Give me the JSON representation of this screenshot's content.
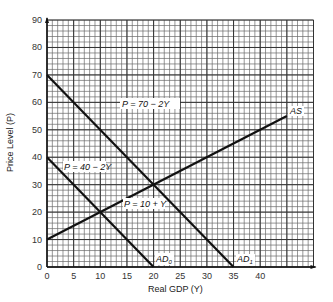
{
  "chart_data": {
    "type": "line",
    "title": "",
    "xlabel": "Real GDP (Y)",
    "ylabel": "Price Level (P)",
    "xlim": [
      0,
      50
    ],
    "ylim": [
      0,
      90
    ],
    "x_ticks": [
      0,
      5,
      10,
      15,
      20,
      25,
      30,
      35,
      40
    ],
    "y_ticks": [
      0,
      10,
      20,
      30,
      40,
      50,
      60,
      70,
      80,
      90
    ],
    "grid": true,
    "series": [
      {
        "name": "AS",
        "equation": "P = 10 + Y",
        "label": "P = 10 + Y",
        "x": [
          0,
          45
        ],
        "y": [
          10,
          55
        ]
      },
      {
        "name": "AD0",
        "equation": "P = 40 - 2Y",
        "label": "P = 40 − 2Y",
        "x": [
          0,
          20
        ],
        "y": [
          40,
          0
        ]
      },
      {
        "name": "AD1",
        "equation": "P = 70 - 2Y",
        "label": "P = 70 − 2Y",
        "x": [
          0,
          35
        ],
        "y": [
          70,
          0
        ]
      }
    ],
    "annotations": [
      {
        "text": "AS",
        "x": 45,
        "y": 55
      },
      {
        "text": "AD0",
        "x": 20,
        "y": 0
      },
      {
        "text": "AD1",
        "x": 35,
        "y": 0
      },
      {
        "text": "P = 70 − 2Y",
        "x": 14,
        "y": 61
      },
      {
        "text": "P = 40 − 2Y",
        "x": 6,
        "y": 37
      },
      {
        "text": "P = 10 + Y",
        "x": 21,
        "y": 22
      }
    ],
    "intersections": [
      {
        "curves": [
          "AS",
          "AD0"
        ],
        "Y": 10,
        "P": 20
      },
      {
        "curves": [
          "AS",
          "AD1"
        ],
        "Y": 20,
        "P": 30
      }
    ]
  },
  "labels": {
    "xlabel": "Real GDP (Y)",
    "ylabel": "Price Level (P)",
    "as": "AS",
    "ad0_main": "AD",
    "ad0_sub": "0",
    "ad1_main": "AD",
    "ad1_sub": "1",
    "eq_ad1": "P = 70 − 2Y",
    "eq_ad0": "P = 40 − 2Y",
    "eq_as": "P = 10 + Y"
  }
}
